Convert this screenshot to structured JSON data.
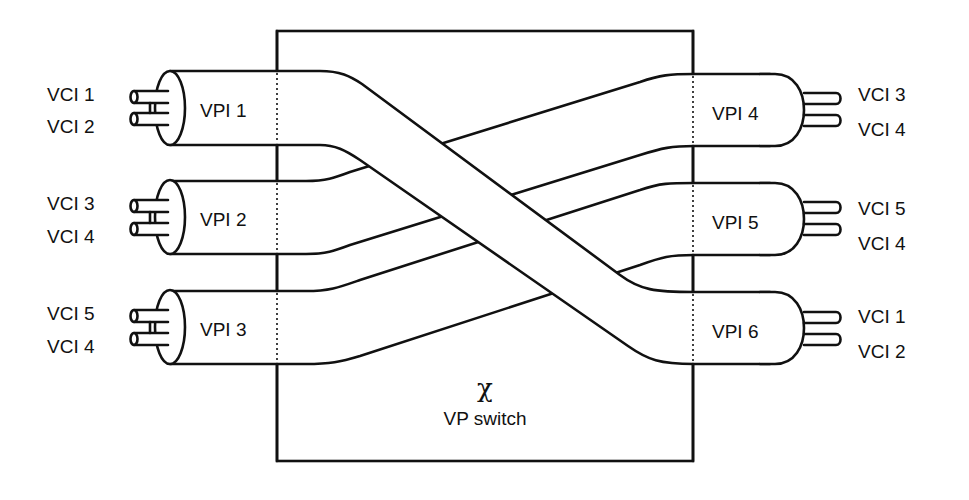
{
  "diagram": {
    "switch_label": "VP switch",
    "switch_symbol": "χ",
    "colors": {
      "line": "#111111",
      "background": "#ffffff"
    },
    "left_ports": [
      {
        "vpi": "VPI 1",
        "vcis": [
          "VCI 1",
          "VCI 2"
        ]
      },
      {
        "vpi": "VPI 2",
        "vcis": [
          "VCI 3",
          "VCI 4"
        ]
      },
      {
        "vpi": "VPI 3",
        "vcis": [
          "VCI 5",
          "VCI 4"
        ]
      }
    ],
    "right_ports": [
      {
        "vpi": "VPI 4",
        "vcis": [
          "VCI 3",
          "VCI 4"
        ]
      },
      {
        "vpi": "VPI 5",
        "vcis": [
          "VCI 5",
          "VCI 4"
        ]
      },
      {
        "vpi": "VPI 6",
        "vcis": [
          "VCI 1",
          "VCI 2"
        ]
      }
    ],
    "connections": [
      {
        "from": "VPI 1",
        "to": "VPI 6"
      },
      {
        "from": "VPI 2",
        "to": "VPI 4"
      },
      {
        "from": "VPI 3",
        "to": "VPI 5"
      }
    ]
  }
}
